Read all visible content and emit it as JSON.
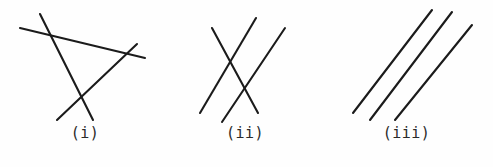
{
  "figure": {
    "width": 493,
    "height": 167,
    "background_color": "#fefefe",
    "line_color": "#1b1b1b",
    "line_width": 2.1,
    "label_color": "#2a2a2a"
  },
  "panels": [
    {
      "id": "panel-i",
      "label": "(i)",
      "label_y": 131,
      "panel_left": 0,
      "panel_width": 170,
      "caption_note": "three mutually intersecting lines forming a triangle with extended ends",
      "lines": [
        {
          "name": "line-a",
          "x1": 20,
          "y1": 28,
          "x2": 145,
          "y2": 58
        },
        {
          "name": "line-b",
          "x1": 40,
          "y1": 14,
          "x2": 93,
          "y2": 120
        },
        {
          "name": "line-c",
          "x1": 57,
          "y1": 120,
          "x2": 137,
          "y2": 44
        }
      ]
    },
    {
      "id": "panel-ii",
      "label": "(ii)",
      "label_y": 131,
      "panel_left": 170,
      "panel_width": 150,
      "caption_note": "two parallel lines crossed by a third transversal line",
      "lines": [
        {
          "name": "line-a",
          "x1": 212,
          "y1": 28,
          "x2": 258,
          "y2": 113
        },
        {
          "name": "line-b",
          "x1": 200,
          "y1": 113,
          "x2": 256,
          "y2": 18
        },
        {
          "name": "line-c",
          "x1": 222,
          "y1": 122,
          "x2": 285,
          "y2": 28
        }
      ]
    },
    {
      "id": "panel-iii",
      "label": "(iii)",
      "label_y": 131,
      "panel_left": 320,
      "panel_width": 173,
      "caption_note": "three parallel lines with no intersections",
      "lines": [
        {
          "name": "line-a",
          "x1": 353,
          "y1": 113,
          "x2": 432,
          "y2": 10
        },
        {
          "name": "line-b",
          "x1": 370,
          "y1": 120,
          "x2": 452,
          "y2": 12
        },
        {
          "name": "line-c",
          "x1": 395,
          "y1": 120,
          "x2": 472,
          "y2": 25
        }
      ]
    }
  ]
}
